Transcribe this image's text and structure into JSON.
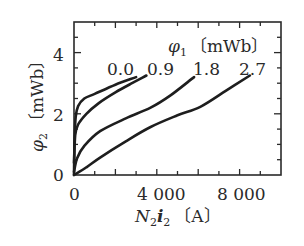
{
  "chart_data": {
    "type": "line",
    "title": "",
    "xlabel": "N2i2 [A]",
    "ylabel": "φ2 [mWb]",
    "xlim": [
      0,
      10000
    ],
    "ylim": [
      0,
      5
    ],
    "x_ticks": [
      0,
      4000,
      8000
    ],
    "x_tick_labels": [
      "0",
      "4 000",
      "8 000"
    ],
    "x_minor_step": 1000,
    "y_ticks": [
      0,
      2,
      4
    ],
    "y_tick_labels": [
      "0",
      "2",
      "4"
    ],
    "y_minor_step": 0.5,
    "grid": false,
    "legend_title": "φ1 [mWb]",
    "series": [
      {
        "name": "0.0",
        "x": [
          0,
          30,
          80,
          200,
          500,
          1000,
          2000,
          3000
        ],
        "y": [
          0,
          1.2,
          1.9,
          2.25,
          2.5,
          2.65,
          2.95,
          3.2
        ]
      },
      {
        "name": "0.9",
        "x": [
          0,
          60,
          200,
          600,
          1200,
          2000,
          2800,
          3500
        ],
        "y": [
          0.4,
          1.3,
          1.65,
          2.0,
          2.35,
          2.7,
          3.0,
          3.25
        ]
      },
      {
        "name": "1.8",
        "x": [
          0,
          150,
          500,
          1260,
          2500,
          3700,
          4660,
          5800
        ],
        "y": [
          0.1,
          0.55,
          0.95,
          1.43,
          1.85,
          2.2,
          2.6,
          3.2
        ]
      },
      {
        "name": "2.7",
        "x": [
          0,
          600,
          1260,
          2500,
          3700,
          5000,
          6100,
          7330,
          8500
        ],
        "y": [
          0,
          0.25,
          0.57,
          1.1,
          1.57,
          1.95,
          2.23,
          2.75,
          3.25
        ]
      }
    ]
  },
  "labels": {
    "legend_symbol": "φ",
    "legend_sub": "1",
    "legend_unit": "〔mWb〕",
    "y_symbol": "φ",
    "y_sub": "2",
    "y_unit": "〔mWb〕",
    "x_N": "N",
    "x_N_sub": "2",
    "x_i": "i",
    "x_i_sub": "2",
    "x_unit": "〔A〕",
    "curve_labels": [
      "0.0",
      "0.9",
      "1.8",
      "2.7"
    ]
  }
}
